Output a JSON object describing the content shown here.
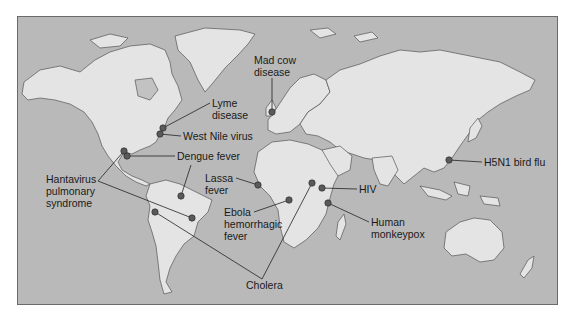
{
  "map": {
    "title": "Emerging infectious diseases world map",
    "colors": {
      "ocean": "#b9b9b9",
      "land": "#e4e4e4",
      "land_shaded": "#c8c8c8",
      "border": "#555555",
      "marker": "#5a5a5a",
      "text": "#1a1a1a"
    },
    "labels": [
      {
        "id": "lyme",
        "lines": [
          "Lyme",
          "disease"
        ]
      },
      {
        "id": "west-nile",
        "lines": [
          "West Nile virus"
        ]
      },
      {
        "id": "dengue",
        "lines": [
          "Dengue fever"
        ]
      },
      {
        "id": "hantavirus",
        "lines": [
          "Hantavirus",
          "pulmonary",
          "syndrome"
        ]
      },
      {
        "id": "mad-cow",
        "lines": [
          "Mad cow",
          "disease"
        ]
      },
      {
        "id": "lassa",
        "lines": [
          "Lassa",
          "fever"
        ]
      },
      {
        "id": "ebola",
        "lines": [
          "Ebola",
          "hemorrhagic",
          "fever"
        ]
      },
      {
        "id": "hiv",
        "lines": [
          "HIV"
        ]
      },
      {
        "id": "monkeypox",
        "lines": [
          "Human",
          "monkeypox"
        ]
      },
      {
        "id": "h5n1",
        "lines": [
          "H5N1 bird flu"
        ]
      },
      {
        "id": "cholera",
        "lines": [
          "Cholera"
        ]
      }
    ]
  }
}
